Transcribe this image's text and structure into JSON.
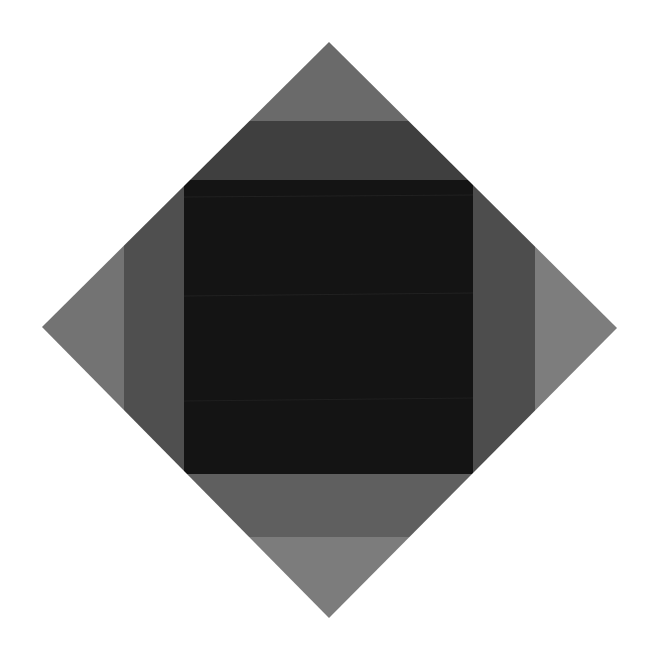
{
  "artwork": {
    "background": "#ffffff",
    "diamond": {
      "top": [
        329,
        42
      ],
      "right": [
        617,
        328
      ],
      "bottom": [
        329,
        618
      ],
      "left": [
        42,
        327
      ]
    },
    "colors": {
      "outer_top": "#6a6a6a",
      "outer_left": "#737373",
      "outer_right": "#7d7d7d",
      "outer_bottom": "#7c7c7c",
      "band_top": "#3f3f3f",
      "band_left": "#4f4f4f",
      "band_right": "#4d4d4d",
      "band_bottom": "#5f5f5f",
      "center": "#141414"
    },
    "bands": {
      "top_y": 121,
      "bottom_y": 537,
      "left_x": 124,
      "right_x": 535
    },
    "center_square": {
      "x": 184,
      "y": 180,
      "width": 289,
      "height": 294
    }
  }
}
